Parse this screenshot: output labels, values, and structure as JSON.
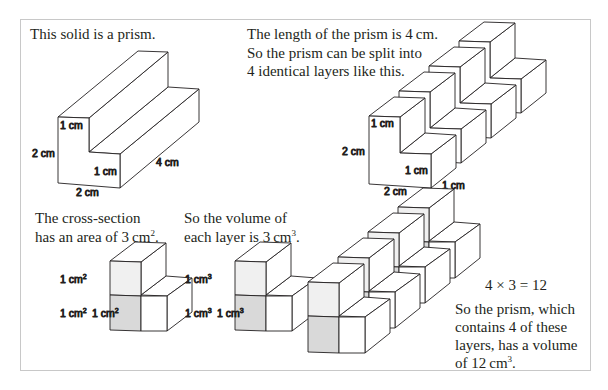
{
  "panels": {
    "intro": {
      "text": "This solid is a prism."
    },
    "layers": {
      "line1": "The length of the prism is 4 cm.",
      "line2": "So the prism can be split into",
      "line3": "4 identical layers like this."
    },
    "cross_section": {
      "line1": "The cross-section",
      "line2_pre": "has an area of 3 cm",
      "line2_sup": "2",
      "line2_post": "."
    },
    "layer_volume": {
      "line1": "So the volume of",
      "line2_pre": "each layer is 3 cm",
      "line2_sup": "3",
      "line2_post": "."
    },
    "total": {
      "equation": "4 × 3 = 12",
      "line1": "So the prism, which",
      "line2": "contains 4 of these",
      "line3": "layers, has a volume",
      "line4_pre": "of 12 cm",
      "line4_sup": "3",
      "line4_post": "."
    }
  },
  "prism_labels": {
    "top_step": "1 cm",
    "height": "2 cm",
    "lower_step": "1 cm",
    "length": "4 cm",
    "width": "2 cm"
  },
  "layer_labels": {
    "top_step": "1 cm",
    "height": "2 cm",
    "lower_step": "1 cm",
    "width": "2 cm",
    "depth": "1 cm"
  },
  "area_labels": {
    "unit": "1 cm",
    "sup": "2"
  },
  "volume_labels": {
    "unit": "1 cm",
    "sup": "3"
  },
  "colors": {
    "shade_dark": "#d9d9d9",
    "shade_light": "#f0f0f0",
    "line": "#231f20",
    "frame": "#c8c8c8"
  }
}
